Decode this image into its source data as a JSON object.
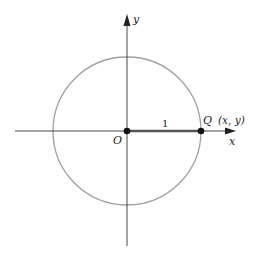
{
  "diagram": {
    "type": "unit-circle",
    "axes": {
      "x_label": "x",
      "y_label": "y"
    },
    "origin_label": "O",
    "point_label": "Q",
    "point_coords": "(x, y)",
    "radius_label": "1",
    "colors": {
      "circle": "#9a9a9a",
      "axes": "#333333",
      "radius_segment": "#555555",
      "points": "#111111"
    }
  }
}
